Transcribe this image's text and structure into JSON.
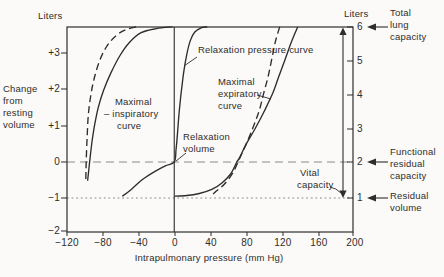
{
  "figure": {
    "left_axis_unit": "Liters",
    "right_axis_unit": "Liters",
    "left_axis_title_lines": [
      "Change",
      "from",
      "resting",
      "volume"
    ],
    "x_axis_title": "Intrapulmonary pressure (mm Hg)",
    "left_ticks": [
      "+3",
      "+2",
      "+1",
      "0",
      "−1",
      "−2"
    ],
    "right_ticks": [
      "6",
      "5",
      "4",
      "3",
      "2",
      "1"
    ],
    "x_ticks": [
      "−120",
      "−80",
      "−40",
      "0",
      "40",
      "80",
      "120",
      "160",
      "200"
    ],
    "labels": {
      "relaxation_pressure_curve": "Relaxation pressure curve",
      "maximal_inspiratory_lines": [
        "Maximal",
        "– inspiratory",
        "curve"
      ],
      "maximal_expiratory_lines": [
        "Maximal",
        "expiratory",
        "curve"
      ],
      "relaxation_volume_lines": [
        "Relaxation",
        "volume"
      ],
      "vital_capacity_lines": [
        "Vital",
        "capacity"
      ],
      "total_lung_capacity_lines": [
        "Total",
        "lung",
        "capacity"
      ],
      "functional_residual_capacity_lines": [
        "Functional",
        "residual",
        "capacity"
      ],
      "residual_volume_lines": [
        "Residual",
        "volume"
      ]
    },
    "colors": {
      "ink": "#2e2d2b",
      "muted": "#8a8a86",
      "background": "#fbfaf8"
    }
  },
  "chart_data": {
    "type": "line",
    "xlabel": "Intrapulmonary pressure (mm Hg)",
    "ylabel_left": "Change from resting volume (Liters)",
    "ylabel_right": "Absolute lung volume (Liters)",
    "xlim": [
      -120,
      200
    ],
    "ylim_left": [
      -2,
      4
    ],
    "ylim_right": [
      0,
      6
    ],
    "x_tick_values": [
      -120,
      -80,
      -40,
      0,
      40,
      80,
      120,
      160,
      200
    ],
    "left_tick_values": [
      3,
      2,
      1,
      0,
      -1,
      -2
    ],
    "right_tick_values": [
      6,
      5,
      4,
      3,
      2,
      1
    ],
    "grid": false,
    "legend": "labels drawn inside plot",
    "series": [
      {
        "name": "Maximal inspiratory curve",
        "style": "solid",
        "points": [
          [
            -97,
            -0.55
          ],
          [
            -95.5,
            -0.2
          ],
          [
            -94,
            0.15
          ],
          [
            -92,
            0.6
          ],
          [
            -89,
            1.1
          ],
          [
            -85,
            1.6
          ],
          [
            -79,
            2.1
          ],
          [
            -71,
            2.6
          ],
          [
            -61,
            3.1
          ],
          [
            -50,
            3.5
          ],
          [
            -37,
            3.78
          ],
          [
            -20,
            3.9
          ],
          [
            -2,
            3.95
          ]
        ]
      },
      {
        "name": "Maximal inspiratory curve (alternate)",
        "style": "dashed",
        "points": [
          [
            -99,
            -0.5
          ],
          [
            -98.5,
            0
          ],
          [
            -97.5,
            0.7
          ],
          [
            -96,
            1.4
          ],
          [
            -93,
            2.0
          ],
          [
            -89,
            2.5
          ],
          [
            -83,
            3.0
          ],
          [
            -75,
            3.4
          ],
          [
            -65,
            3.7
          ],
          [
            -54,
            3.87
          ],
          [
            -42,
            3.95
          ]
        ]
      },
      {
        "name": "Relaxation pressure curve",
        "style": "solid",
        "points": [
          [
            -58,
            -1.0
          ],
          [
            -48,
            -0.8
          ],
          [
            -36,
            -0.52
          ],
          [
            -22,
            -0.28
          ],
          [
            -10,
            -0.11
          ],
          [
            0,
            0
          ],
          [
            2,
            0.35
          ],
          [
            3.5,
            0.8
          ],
          [
            5,
            1.3
          ],
          [
            7,
            1.85
          ],
          [
            9,
            2.3
          ],
          [
            11,
            2.7
          ],
          [
            14,
            3.15
          ],
          [
            18,
            3.55
          ],
          [
            23,
            3.8
          ],
          [
            30,
            3.92
          ],
          [
            37,
            3.95
          ]
        ]
      },
      {
        "name": "Maximal expiratory curve",
        "style": "solid",
        "points": [
          [
            138,
            3.95
          ],
          [
            131,
            3.5
          ],
          [
            124,
            3.0
          ],
          [
            117,
            2.5
          ],
          [
            110,
            2.0
          ],
          [
            101,
            1.5
          ],
          [
            91,
            1.0
          ],
          [
            80,
            0.5
          ],
          [
            73,
            0.12
          ],
          [
            70,
            0
          ],
          [
            63,
            -0.35
          ],
          [
            53,
            -0.62
          ],
          [
            42,
            -0.8
          ],
          [
            28,
            -0.92
          ],
          [
            14,
            -0.98
          ],
          [
            0,
            -1.0
          ]
        ]
      },
      {
        "name": "Maximal expiratory curve (alternate)",
        "style": "dashed",
        "points": [
          [
            118,
            3.95
          ],
          [
            113,
            3.5
          ],
          [
            109,
            3.0
          ],
          [
            105,
            2.5
          ],
          [
            100,
            2.0
          ],
          [
            95,
            1.5
          ],
          [
            88,
            1.0
          ],
          [
            80,
            0.5
          ],
          [
            73,
            0.1
          ],
          [
            66,
            -0.3
          ],
          [
            56,
            -0.65
          ],
          [
            47,
            -0.85
          ],
          [
            41,
            -1.0
          ]
        ]
      }
    ],
    "reference_lines": [
      {
        "y_left": 0,
        "y_right": 2,
        "style": "dashed",
        "meaning": "Functional residual capacity"
      },
      {
        "y_left": -1,
        "y_right": 1,
        "style": "dotted",
        "meaning": "Residual volume"
      }
    ],
    "annotations": [
      {
        "text": "Relaxation volume",
        "at": [
          0,
          0
        ]
      },
      {
        "text": "Total lung capacity",
        "right_axis_value": 6
      },
      {
        "text": "Functional residual capacity",
        "right_axis_value": 2
      },
      {
        "text": "Residual volume",
        "right_axis_value": 1
      },
      {
        "text": "Vital capacity",
        "right_axis_span": [
          1,
          6
        ]
      }
    ]
  }
}
